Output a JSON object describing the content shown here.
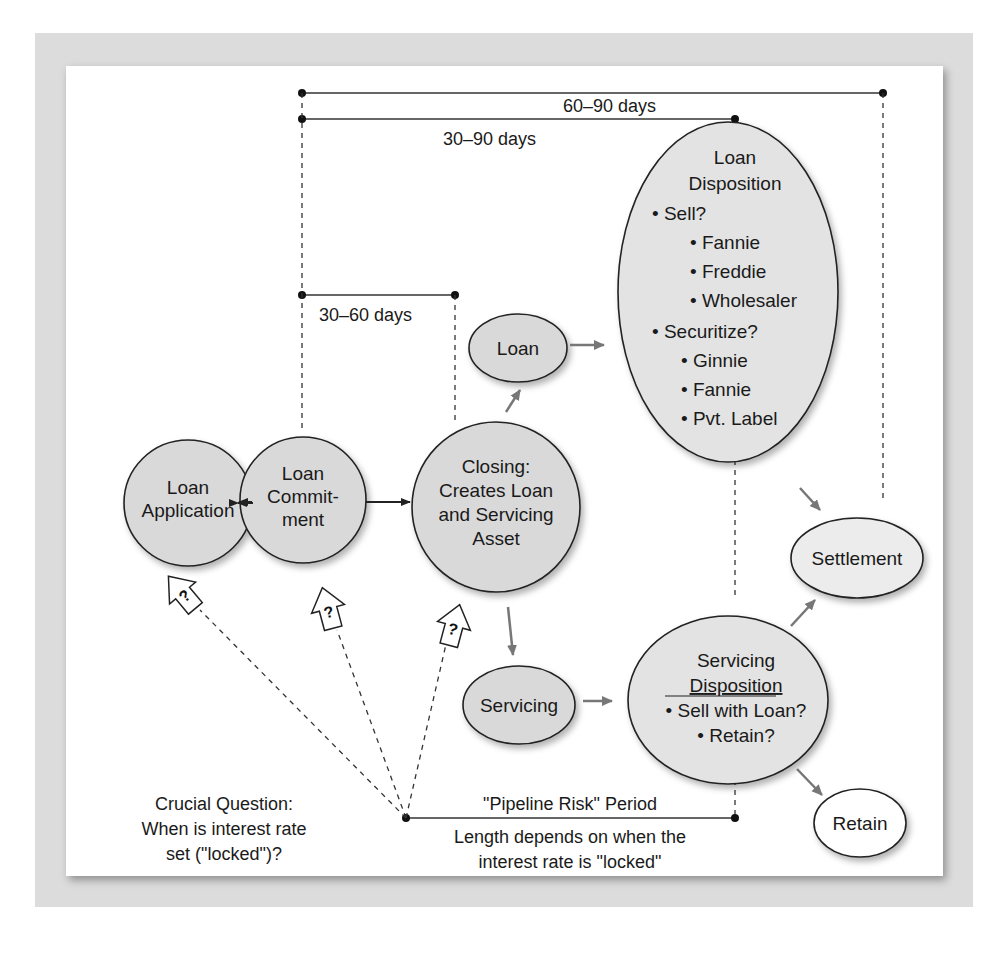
{
  "caption": "…e e  i  g",
  "timelines": [
    {
      "label": "60–90 days",
      "x1": 302,
      "x2": 883,
      "y": 93
    },
    {
      "label": "30–90 days",
      "x1": 302,
      "x2": 735,
      "y": 119
    },
    {
      "label": "30–60 days",
      "x1": 302,
      "x2": 455,
      "y": 295
    }
  ],
  "nodes": {
    "loan_application": {
      "lines": [
        "Loan",
        "Application"
      ]
    },
    "loan_commitment": {
      "lines": [
        "Loan",
        "Commit-",
        "ment"
      ]
    },
    "closing": {
      "lines": [
        "Closing:",
        "Creates Loan",
        "and Servicing",
        "Asset"
      ]
    },
    "loan": {
      "lines": [
        "Loan"
      ]
    },
    "servicing": {
      "lines": [
        "Servicing"
      ]
    },
    "loan_disposition": {
      "title": [
        "Loan",
        "Disposition"
      ],
      "items": [
        "• Sell?",
        "• Fannie",
        "• Freddie",
        "• Wholesaler",
        "• Securitize?",
        "• Ginnie",
        "• Fannie",
        "• Pvt. Label"
      ]
    },
    "servicing_disposition": {
      "title": [
        "Servicing",
        "Disposition"
      ],
      "items": [
        "• Sell with Loan?",
        "• Retain?"
      ]
    },
    "settlement": {
      "lines": [
        "Settlement"
      ]
    },
    "retain": {
      "lines": [
        "Retain"
      ]
    }
  },
  "lock_markers": [
    "?",
    "?",
    "?"
  ],
  "crucial_question": [
    "Crucial Question:",
    "When is interest rate",
    "set (\"locked\")?"
  ],
  "pipeline": {
    "title": "\"Pipeline Risk\" Period",
    "note": [
      "Length depends on when the",
      "interest rate is \"locked\""
    ]
  },
  "colors": {
    "node_fill": "#d9d9d9",
    "node_fill_light": "#e8e8e8",
    "stroke": "#222222",
    "gray_arrow": "#777777",
    "frame": "#dcdcdc"
  }
}
